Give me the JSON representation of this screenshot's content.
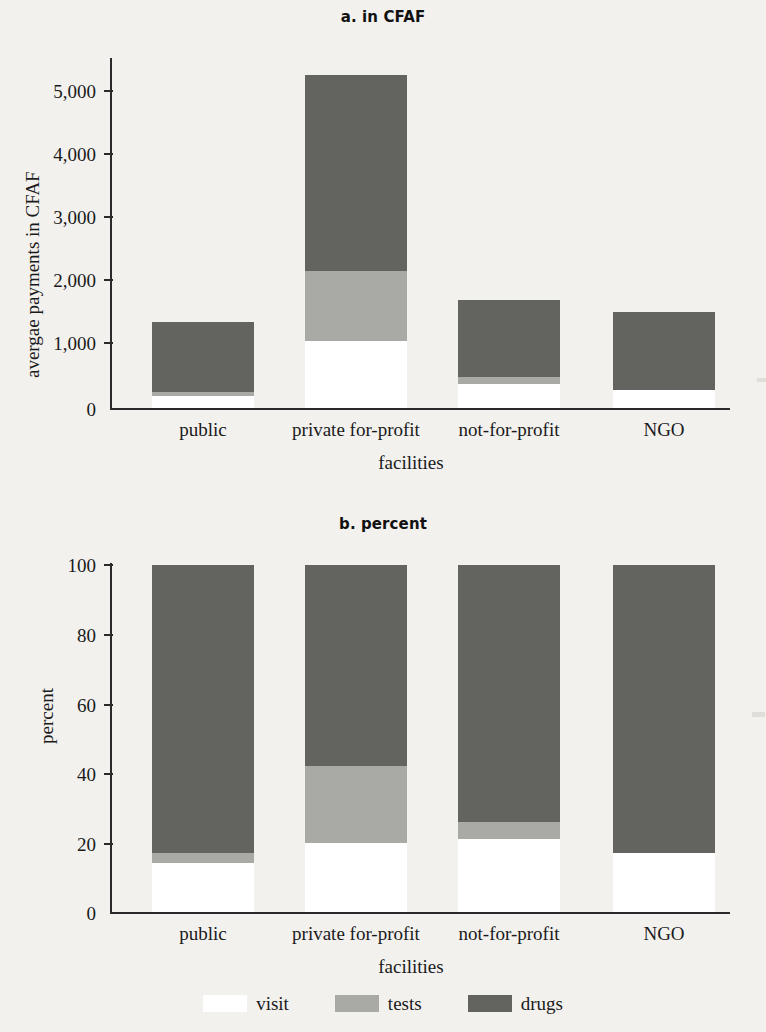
{
  "figure": {
    "background_color": "#f2f1ee",
    "series_colors": {
      "visit": "#ffffff",
      "tests": "#a9a9a6",
      "drugs": "#636360"
    }
  },
  "legend": {
    "position": "bottom-center",
    "items": [
      {
        "key": "visit",
        "label": "visit",
        "color": "#ffffff"
      },
      {
        "key": "tests",
        "label": "tests",
        "color": "#a9a9a6"
      },
      {
        "key": "drugs",
        "label": "drugs",
        "color": "#636360"
      }
    ]
  },
  "panel_a": {
    "title": "a. in CFAF",
    "ylabel": "avergae payments in CFAF",
    "xlabel": "facilities",
    "yticks": [
      "0",
      "1,000",
      "2,000",
      "3,000",
      "4,000",
      "5,000"
    ],
    "categories": [
      "public",
      "private for-profit",
      "not-for-profit",
      "NGO"
    ]
  },
  "panel_b": {
    "title": "b. percent",
    "ylabel": "percent",
    "xlabel": "facilities",
    "yticks": [
      "0",
      "20",
      "40",
      "60",
      "80",
      "100"
    ],
    "categories": [
      "public",
      "private for-profit",
      "not-for-profit",
      "NGO"
    ]
  },
  "chart_data": [
    {
      "id": "panel_a",
      "type": "bar",
      "subtype": "stacked",
      "title": "a. in CFAF",
      "xlabel": "facilities",
      "ylabel": "avergae payments in CFAF",
      "categories": [
        "public",
        "private for-profit",
        "not-for-profit",
        "NGO"
      ],
      "series": [
        {
          "name": "visit",
          "color": "#ffffff",
          "values": [
            190,
            1060,
            380,
            290
          ]
        },
        {
          "name": "tests",
          "color": "#a9a9a6",
          "values": [
            60,
            1120,
            110,
            0
          ]
        },
        {
          "name": "drugs",
          "color": "#636360",
          "values": [
            1115,
            3100,
            1230,
            1230
          ]
        }
      ],
      "totals": [
        1365,
        5280,
        1720,
        1520
      ],
      "ylim": [
        0,
        5500
      ],
      "yticks": [
        0,
        1000,
        2000,
        3000,
        4000,
        5000
      ],
      "ytick_labels": [
        "0",
        "1,000",
        "2,000",
        "3,000",
        "4,000",
        "5,000"
      ],
      "grid": false,
      "legend": "bottom"
    },
    {
      "id": "panel_b",
      "type": "bar",
      "subtype": "stacked-100",
      "title": "b. percent",
      "xlabel": "facilities",
      "ylabel": "percent",
      "categories": [
        "public",
        "private for-profit",
        "not-for-profit",
        "NGO"
      ],
      "series": [
        {
          "name": "visit",
          "color": "#ffffff",
          "values": [
            14,
            20,
            21,
            17
          ]
        },
        {
          "name": "tests",
          "color": "#a9a9a6",
          "values": [
            3,
            22,
            5,
            0
          ]
        },
        {
          "name": "drugs",
          "color": "#636360",
          "values": [
            83,
            58,
            74,
            83
          ]
        }
      ],
      "totals": [
        100,
        100,
        100,
        100
      ],
      "ylim": [
        0,
        101
      ],
      "yticks": [
        0,
        20,
        40,
        60,
        80,
        100
      ],
      "ytick_labels": [
        "0",
        "20",
        "40",
        "60",
        "80",
        "100"
      ],
      "grid": false,
      "legend": "bottom"
    }
  ]
}
